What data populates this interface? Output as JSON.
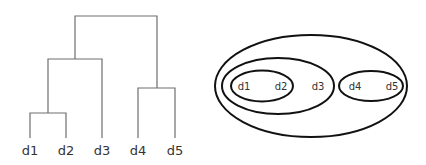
{
  "dendrogram": {
    "leaves": [
      {
        "label": "d1",
        "x": 30
      },
      {
        "label": "d2",
        "x": 66
      },
      {
        "label": "d3",
        "x": 102
      },
      {
        "label": "d4",
        "x": 138
      },
      {
        "label": "d5",
        "x": 175
      }
    ]
  },
  "nested_sets": {
    "labels": [
      {
        "label": "d1",
        "x": 244
      },
      {
        "label": "d2",
        "x": 281
      },
      {
        "label": "d3",
        "x": 318
      },
      {
        "label": "d4",
        "x": 355
      },
      {
        "label": "d5",
        "x": 392
      }
    ]
  }
}
